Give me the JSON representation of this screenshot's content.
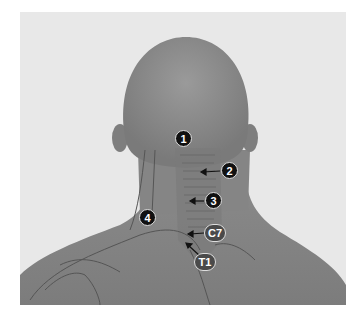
{
  "figure": {
    "markers": [
      {
        "id": "1",
        "label": "1",
        "style": "black"
      },
      {
        "id": "2",
        "label": "2",
        "style": "black"
      },
      {
        "id": "3",
        "label": "3",
        "style": "black"
      },
      {
        "id": "4",
        "label": "4",
        "style": "black"
      },
      {
        "id": "c7",
        "label": "C7",
        "style": "gray"
      },
      {
        "id": "t1",
        "label": "T1",
        "style": "gray"
      }
    ],
    "colors": {
      "background": "#e8e8e8",
      "skin": "#8a8a8a",
      "marker_black": "#111111",
      "marker_gray": "#4a4a4a"
    }
  }
}
